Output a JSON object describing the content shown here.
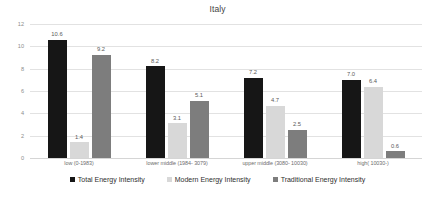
{
  "chart_data": {
    "type": "bar",
    "title": "Italy",
    "xlabel": "",
    "ylabel": "",
    "ylim": [
      0,
      12
    ],
    "yticks": [
      0,
      2,
      4,
      6,
      8,
      10,
      12
    ],
    "grid": true,
    "legend_position": "bottom",
    "categories": [
      "low (0-1983)",
      "lower middle (1984- 3079)",
      "upper middle (3080- 10030)",
      "high( 10030-)"
    ],
    "series": [
      {
        "name": "Total Energy Intensity",
        "color": "#161616",
        "values": [
          10.6,
          8.2,
          7.2,
          7.0
        ],
        "labels": [
          "10.6",
          "8.2",
          "7.2",
          "7.0"
        ]
      },
      {
        "name": "Modern Energy Intensity",
        "color": "#d8d8d8",
        "values": [
          1.4,
          3.1,
          4.7,
          6.4
        ],
        "labels": [
          "1.4",
          "3.1",
          "4.7",
          "6.4"
        ]
      },
      {
        "name": "Traditional Energy Intensity",
        "color": "#7d7d7d",
        "values": [
          9.2,
          5.1,
          2.5,
          0.6
        ],
        "labels": [
          "9.2",
          "5.1",
          "2.5",
          "0.6"
        ]
      }
    ]
  }
}
